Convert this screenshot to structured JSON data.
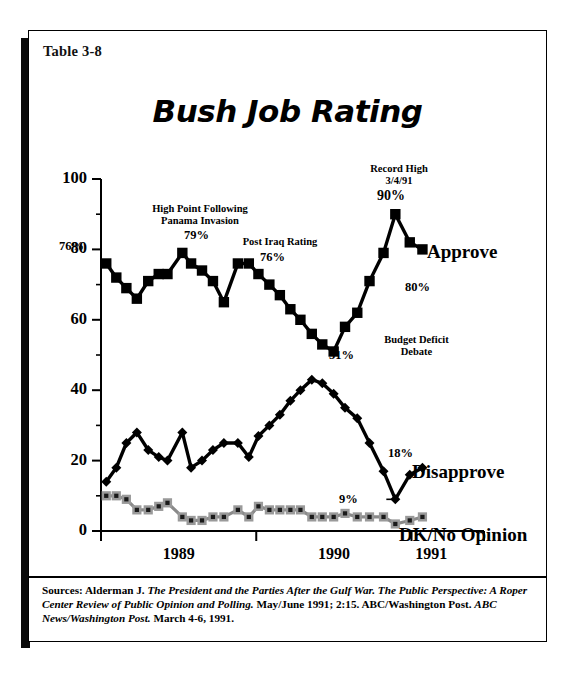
{
  "table_label": "Table 3-8",
  "title": "Bush Job Rating",
  "axes": {
    "y_ticks_major": [
      0,
      20,
      40,
      60,
      80,
      100
    ],
    "y_ticks_minor": [
      10,
      30,
      50,
      70,
      90
    ],
    "x_tick_labels": [
      "1989",
      "1990",
      "1991"
    ],
    "ylim": [
      0,
      100
    ]
  },
  "annotations": [
    {
      "name": "panama-annotation",
      "text": "High Point Following\nPanama Invasion"
    },
    {
      "name": "post-iraq-annotation",
      "text": "Post Iraq Rating"
    },
    {
      "name": "record-high-annotation",
      "text": "Record High\n3/4/91"
    },
    {
      "name": "budget-deficit-annotation",
      "text": "Budget Deficit\nDebate"
    }
  ],
  "value_labels": {
    "start_approve": "76%",
    "panama_peak": "79%",
    "post_iraq": "76%",
    "record_high": "90%",
    "end_approve": "80%",
    "low_approve": "51%",
    "end_disapprove": "18%",
    "low_disapprove": "9%"
  },
  "series_labels": {
    "approve": "Approve",
    "disapprove": "Disapprove",
    "dk": "DK/No Opinion"
  },
  "colors": {
    "approve": "#000000",
    "disapprove": "#000000",
    "dk": "#8a8a8a",
    "frame": "#000000",
    "background": "#ffffff"
  },
  "sources": {
    "prefix": "Sources: Alderman J. ",
    "italic1": "The President and the Parties After the Gulf War. The Public Perspective: A Roper Center Review of Public Opinion and Polling.",
    "middle": " May/June 1991; 2:15. ABC/Washington Post. ",
    "italic2": "ABC News/Washington Post.",
    "suffix": " March 4-6, 1991."
  },
  "chart_data": {
    "type": "line",
    "title": "Bush Job Rating",
    "xlabel": "",
    "ylabel": "",
    "ylim": [
      0,
      100
    ],
    "grid": false,
    "legend": "inline-right",
    "x_axis_type": "time",
    "x_tick_labels": [
      "1989",
      "1990",
      "1991"
    ],
    "x_year_boundaries": [
      0.0,
      0.355,
      0.71
    ],
    "series": [
      {
        "name": "Approve",
        "marker": "square",
        "color": "#000000",
        "values": [
          76,
          72,
          69,
          66,
          71,
          73,
          73,
          79,
          76,
          74,
          71,
          65,
          76,
          76,
          73,
          70,
          67,
          63,
          60,
          56,
          53,
          51,
          58,
          62,
          71,
          79,
          90,
          82,
          80
        ],
        "x": [
          0.012,
          0.035,
          0.058,
          0.082,
          0.108,
          0.132,
          0.152,
          0.186,
          0.206,
          0.231,
          0.256,
          0.281,
          0.313,
          0.338,
          0.36,
          0.385,
          0.409,
          0.433,
          0.456,
          0.482,
          0.506,
          0.532,
          0.558,
          0.586,
          0.614,
          0.646,
          0.673,
          0.706,
          0.735
        ]
      },
      {
        "name": "Disapprove",
        "marker": "diamond",
        "color": "#000000",
        "values": [
          14,
          18,
          25,
          28,
          23,
          21,
          20,
          28,
          18,
          20,
          23,
          25,
          25,
          21,
          27,
          30,
          33,
          37,
          40,
          43,
          42,
          39,
          35,
          32,
          25,
          17,
          9,
          16,
          18
        ],
        "x": [
          0.012,
          0.035,
          0.058,
          0.082,
          0.108,
          0.132,
          0.152,
          0.186,
          0.206,
          0.231,
          0.256,
          0.281,
          0.313,
          0.338,
          0.36,
          0.385,
          0.409,
          0.433,
          0.456,
          0.482,
          0.506,
          0.532,
          0.558,
          0.586,
          0.614,
          0.646,
          0.673,
          0.706,
          0.735
        ]
      },
      {
        "name": "DK/No Opinion",
        "marker": "square",
        "color": "#8a8a8a",
        "values": [
          10,
          10,
          9,
          6,
          6,
          7,
          8,
          4,
          3,
          3,
          4,
          4,
          6,
          4,
          7,
          6,
          6,
          6,
          6,
          4,
          4,
          4,
          5,
          4,
          4,
          4,
          2,
          3,
          4
        ],
        "x": [
          0.012,
          0.035,
          0.058,
          0.082,
          0.108,
          0.132,
          0.152,
          0.186,
          0.206,
          0.231,
          0.256,
          0.281,
          0.313,
          0.338,
          0.36,
          0.385,
          0.409,
          0.433,
          0.456,
          0.482,
          0.506,
          0.532,
          0.558,
          0.586,
          0.614,
          0.646,
          0.673,
          0.706,
          0.735
        ]
      }
    ],
    "callouts": [
      {
        "label": "High Point Following Panama Invasion",
        "value": 79
      },
      {
        "label": "Post Iraq Rating",
        "value": 76
      },
      {
        "label": "Record High 3/4/91",
        "value": 90
      },
      {
        "label": "Budget Deficit Debate",
        "value": 51
      }
    ]
  }
}
